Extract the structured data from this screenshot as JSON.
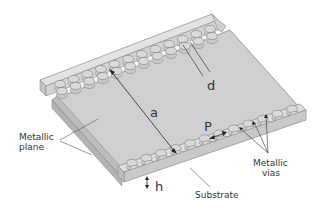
{
  "diagram": {
    "labels": {
      "metallic_plane": [
        "Metallic",
        "plane"
      ],
      "metallic_vias": [
        "Metallic",
        "vias"
      ],
      "substrate": "Substrate",
      "a": "a",
      "d": "d",
      "p": "P",
      "h": "h"
    },
    "via_count_per_row": 12,
    "colors": {
      "plane": "#cfcfcf",
      "rail_top": "#dcdcdc",
      "rail_side": "#bdbdbd",
      "edge": "#8a8a8a",
      "via_fill": "#d6d6d6",
      "leader": "#555555",
      "arrow": "#222222"
    }
  }
}
